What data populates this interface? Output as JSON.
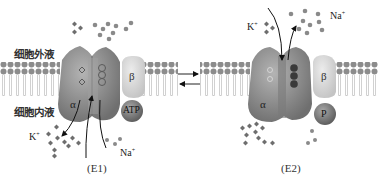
{
  "diagram": {
    "labels": {
      "extracellular": "细胞外液",
      "intracellular": "细胞内液"
    },
    "states": [
      {
        "id": "E1",
        "caption": "(E1)",
        "alpha_label": "α",
        "beta_label": "β",
        "bound_molecule": "ATP",
        "ions": {
          "k_label": "K",
          "k_charge": "+",
          "na_label": "Na",
          "na_charge": "+"
        }
      },
      {
        "id": "E2",
        "caption": "(E2)",
        "alpha_label": "α",
        "beta_label": "β",
        "bound_molecule": "P",
        "ions": {
          "k_label": "K",
          "k_charge": "+",
          "na_label": "Na",
          "na_charge": "+"
        }
      }
    ],
    "transition": "reversible",
    "colors": {
      "protein_alpha": "#8a8a8a",
      "protein_beta": "#d6d6d6",
      "atp": "#7a7a7a",
      "lipid_head": "#8c8c8c",
      "ion_k": "#6e6e6e",
      "ion_na": "#8a8a8a",
      "bound_na": "#3a3a3a"
    }
  }
}
